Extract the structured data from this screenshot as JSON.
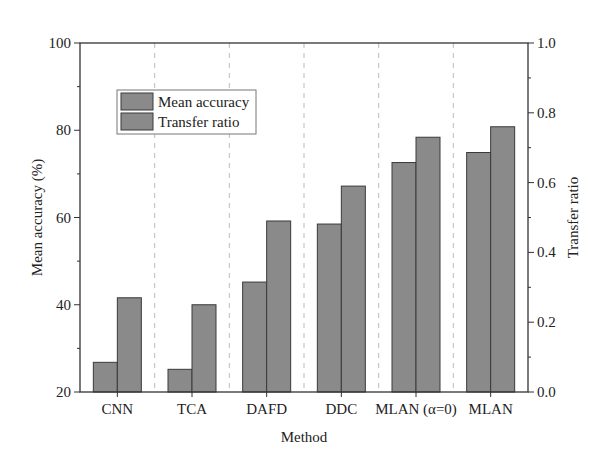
{
  "chart_data": {
    "type": "bar",
    "title": "",
    "xlabel": "Method",
    "ylabel": "Mean accuracy (%)",
    "y2label": "Transfer ratio",
    "categories": [
      "CNN",
      "TCA",
      "DAFD",
      "DDC",
      "MLAN (α=0)",
      "MLAN"
    ],
    "series": [
      {
        "name": "Mean accuracy",
        "axis": "left",
        "values": [
          26.8,
          25.2,
          45.2,
          58.5,
          72.6,
          74.9
        ]
      },
      {
        "name": "Transfer ratio",
        "axis": "right",
        "values": [
          0.27,
          0.25,
          0.49,
          0.59,
          0.73,
          0.76
        ]
      }
    ],
    "ylim": [
      20,
      100
    ],
    "y2lim": [
      0.0,
      1.0
    ],
    "yticks": [
      "20",
      "40",
      "60",
      "80",
      "100"
    ],
    "y2ticks": [
      "0.0",
      "0.2",
      "0.4",
      "0.6",
      "0.8",
      "1.0"
    ],
    "legend_position": "upper left",
    "grid": "vertical dashed separators between categories"
  },
  "colors": {
    "bar_fill": "#8a8a8a",
    "bar_edge": "#3a3a3a",
    "axis": "#333333",
    "separator": "#bbbbbb"
  }
}
